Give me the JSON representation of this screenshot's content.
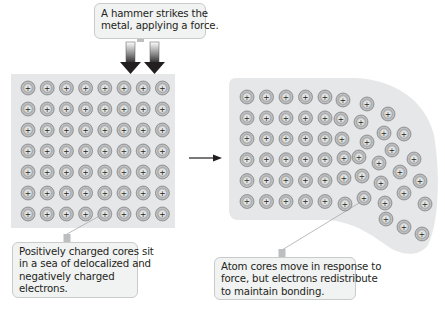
{
  "colors": {
    "background": "#ffffff",
    "panel": "#e6e7e8",
    "atom_ring": "#8f9091",
    "atom_mid": "#b5b6b7",
    "atom_core": "#e2e3e3",
    "leader": "#a7a9ac",
    "arrow": "#231f20",
    "callout_bg": "#f1f2f2"
  },
  "callouts": {
    "hammer": {
      "lines": [
        "A hammer strikes the",
        "metal, applying a force."
      ]
    },
    "left": {
      "lines": [
        "Positively charged cores sit",
        "in a sea of delocalized and",
        "negatively charged",
        "electrons."
      ]
    },
    "right": {
      "lines": [
        "Atom cores move in response to",
        "force, but electrons redistribute",
        "to maintain bonding."
      ]
    }
  },
  "atom_symbol": "+",
  "left_lattice": {
    "columns": 8,
    "rows": 7,
    "origin": [
      28,
      88
    ],
    "spacing": [
      19.2,
      21
    ]
  },
  "right_lattice": {
    "regular": {
      "columns": 5,
      "rows": 6,
      "origin": [
        247,
        97
      ],
      "spacing": [
        19.5,
        20.9
      ]
    },
    "displaced": [
      [
        343,
        100
      ],
      [
        367,
        104
      ],
      [
        341,
        119
      ],
      [
        361,
        122
      ],
      [
        388,
        114
      ],
      [
        342,
        139
      ],
      [
        367,
        142
      ],
      [
        384,
        133
      ],
      [
        404,
        134
      ],
      [
        344,
        158
      ],
      [
        359,
        157
      ],
      [
        379,
        163
      ],
      [
        392,
        150
      ],
      [
        414,
        159
      ],
      [
        344,
        178
      ],
      [
        362,
        176
      ],
      [
        381,
        183
      ],
      [
        400,
        172
      ],
      [
        420,
        181
      ],
      [
        345,
        204
      ],
      [
        364,
        198
      ],
      [
        385,
        203
      ],
      [
        404,
        193
      ],
      [
        425,
        204
      ],
      [
        386,
        219
      ],
      [
        404,
        227
      ],
      [
        422,
        234
      ]
    ]
  }
}
